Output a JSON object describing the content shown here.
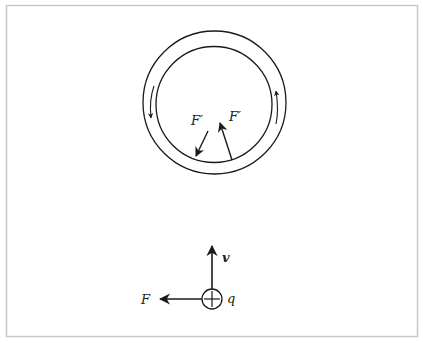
{
  "diagram": {
    "frame": {
      "x": 6.5,
      "y": 5.5,
      "width": 411,
      "height": 331,
      "stroke": "#c8c8c8"
    },
    "ring": {
      "outer": {
        "cx": 214.5,
        "cy": 102.5,
        "r": 71.5
      },
      "inner": {
        "cx": 214,
        "cy": 104.5,
        "r": 58
      },
      "current_arrows": [
        {
          "side": "left",
          "direction": "down"
        },
        {
          "side": "right",
          "direction": "up"
        }
      ]
    },
    "forces_on_ring": [
      {
        "label": "F′",
        "direction": "down-left",
        "from": [
          208,
          130
        ],
        "to": [
          195,
          156
        ]
      },
      {
        "label": "F′",
        "direction": "up-left",
        "from": [
          232,
          160
        ],
        "to": [
          219,
          122
        ]
      }
    ],
    "charge": {
      "label": "q",
      "sign": "+",
      "cx": 212,
      "cy": 299,
      "r": 10,
      "velocity_label": "v",
      "force_label": "F"
    },
    "colors": {
      "ink": "#1a1a1a",
      "frame": "#c8c8c8",
      "background": "#ffffff"
    }
  }
}
